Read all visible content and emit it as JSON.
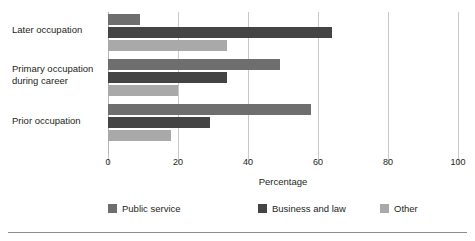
{
  "chart_data": {
    "type": "bar",
    "orientation": "horizontal",
    "title": "",
    "xlabel": "Percentage",
    "ylabel": "",
    "xlim": [
      0,
      100
    ],
    "xticks": [
      0,
      20,
      40,
      60,
      80,
      100
    ],
    "grid": true,
    "legend_position": "bottom",
    "categories": [
      "Later occupation",
      "Primary occupation during career",
      "Prior occupation"
    ],
    "category_labels": [
      [
        "Later occupation"
      ],
      [
        "Primary occupation",
        "during career"
      ],
      [
        "Prior occupation"
      ]
    ],
    "series": [
      {
        "name": "Public service",
        "color": "#6e6e6e",
        "values": [
          9,
          49,
          58
        ]
      },
      {
        "name": "Business and law",
        "color": "#444444",
        "values": [
          64,
          34,
          29
        ]
      },
      {
        "name": "Other",
        "color": "#a9a9a9",
        "values": [
          34,
          20,
          18
        ]
      }
    ]
  },
  "axis": {
    "tick_labels": [
      "0",
      "20",
      "40",
      "60",
      "80",
      "100"
    ],
    "x_title": "Percentage"
  },
  "legend": {
    "items": [
      {
        "label": "Public service",
        "color": "#6e6e6e"
      },
      {
        "label": "Business and law",
        "color": "#444444"
      },
      {
        "label": "Other",
        "color": "#a9a9a9"
      }
    ]
  }
}
